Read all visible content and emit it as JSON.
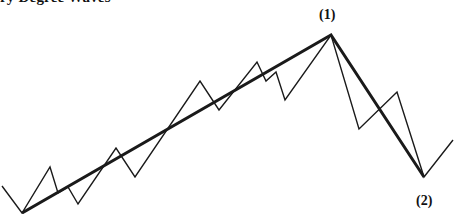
{
  "title": "ry Degree Waves",
  "labels": {
    "point1": "(1)",
    "point2": "(2)"
  },
  "colors": {
    "line": "#1a1a1a",
    "background": "#ffffff"
  },
  "diagram": {
    "primary_wave_points": "22,213 331,35 424,177",
    "sub_wave_points": "2,186 22,213 50,167 58,193 68,187 78,204 116,148 135,177 200,81 219,110 257,62 266,81 276,72 285,100 331,35 359,129 397,92 424,177 453,140"
  }
}
